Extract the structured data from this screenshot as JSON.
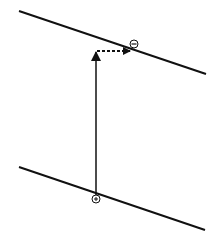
{
  "diagram": {
    "top_line": {
      "x1": 19,
      "y1": 11,
      "x2": 206,
      "y2": 74
    },
    "bottom_line": {
      "x1": 19,
      "y1": 167,
      "x2": 205,
      "y2": 230
    },
    "vertical_arrow": {
      "x": 96,
      "y_start": 196,
      "y_end": 50
    },
    "dashed_arrow": {
      "x_start": 97,
      "x_end": 130,
      "y": 51
    },
    "markers": [
      {
        "symbol": "−",
        "label": "negative-charge",
        "cx": 134,
        "cy": 44
      },
      {
        "symbol": "+",
        "label": "positive-charge",
        "cx": 96,
        "cy": 199
      }
    ],
    "colors": {
      "stroke": "#111111",
      "background": "#ffffff"
    }
  }
}
